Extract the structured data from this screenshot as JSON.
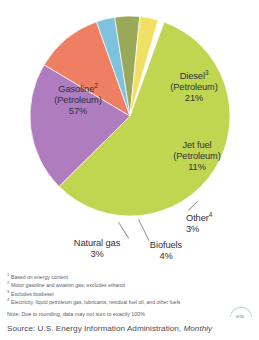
{
  "chart_data": {
    "type": "pie",
    "title": "",
    "categories": [
      "Gasoline (Petroleum)",
      "Diesel (Petroleum)",
      "Jet fuel (Petroleum)",
      "Other",
      "Biofuels",
      "Natural gas"
    ],
    "values": [
      57,
      21,
      11,
      3,
      4,
      3
    ],
    "unit": "%",
    "legend_position": "labels-on-and-around-slices",
    "grid": false,
    "slices": [
      {
        "key": "gasoline",
        "name": "Gasoline",
        "name_line": "Gasoline",
        "footnote_mark": "2",
        "sub_line": "(Petroleum)",
        "value": 57,
        "value_label": "57%",
        "color": "#c0d650",
        "start_angle_deg": 20,
        "sweep_deg": 205.2
      },
      {
        "key": "diesel",
        "name": "Diesel",
        "name_line": "Diesel",
        "footnote_mark": "3",
        "sub_line": "(Petroleum)",
        "value": 21,
        "value_label": "21%",
        "color": "#b07cc0",
        "start_angle_deg": -55.6,
        "sweep_deg": 75.6
      },
      {
        "key": "jet-fuel",
        "name": "Jet fuel",
        "name_line": "Jet fuel",
        "footnote_mark": "",
        "sub_line": "(Petroleum)",
        "value": 11,
        "value_label": "11%",
        "color": "#ef7f63",
        "start_angle_deg": -95.2,
        "sweep_deg": 39.6
      },
      {
        "key": "other",
        "name": "Other",
        "name_line": "Other",
        "footnote_mark": "4",
        "sub_line": "",
        "value": 3,
        "value_label": "3%",
        "color": "#7ec2dd",
        "start_angle_deg": -106,
        "sweep_deg": 10.8
      },
      {
        "key": "biofuels",
        "name": "Biofuels",
        "name_line": "Biofuels",
        "footnote_mark": "",
        "sub_line": "",
        "value": 4,
        "value_label": "4%",
        "color": "#9aa85a",
        "start_angle_deg": -120.4,
        "sweep_deg": 14.4
      },
      {
        "key": "natural-gas",
        "name": "Natural gas",
        "name_line": "Natural gas",
        "footnote_mark": "",
        "sub_line": "",
        "value": 3,
        "value_label": "3%",
        "color": "#f2e066",
        "start_angle_deg": -131.2,
        "sweep_deg": 10.8
      }
    ]
  },
  "labels": {
    "gasoline": {
      "name": "Gasoline",
      "mark": "2",
      "sub": "(Petroleum)",
      "value": "57%"
    },
    "diesel": {
      "name": "Diesel",
      "mark": "3",
      "sub": "(Petroleum)",
      "value": "21%"
    },
    "jet_fuel": {
      "name": "Jet fuel",
      "mark": "",
      "sub": "(Petroleum)",
      "value": "11%"
    },
    "other": {
      "name": "Other",
      "mark": "4",
      "value": "3%"
    },
    "biofuels": {
      "name": "Biofuels",
      "value": "4%"
    },
    "natural_gas": {
      "name": "Natural gas",
      "value": "3%"
    }
  },
  "footnotes": [
    {
      "mark": "1",
      "text": "Based on energy content"
    },
    {
      "mark": "2",
      "text": "Motor gasoline and aviation gas; excludes ethanol"
    },
    {
      "mark": "3",
      "text": "Excludes biodiesel"
    },
    {
      "mark": "4",
      "text": "Electricity, liquid petroleum gas, lubricants, residual fuel oil, and other fuels"
    }
  ],
  "note": "Note: Due to rounding, data may not sum to exactly 100%",
  "source": {
    "prefix": "Source: U.S. Energy Information Administration, ",
    "italic": "Monthly"
  },
  "logo": {
    "mark": "eia"
  }
}
